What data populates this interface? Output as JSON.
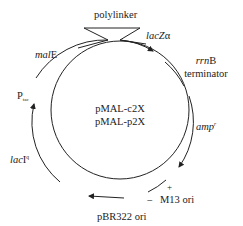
{
  "plasmid": {
    "names": [
      "pMAL-c2X",
      "pMAL-p2X"
    ],
    "line_color": "#222222"
  },
  "labels": {
    "polylinker": "polylinker",
    "lacZ_italic": "lacZ",
    "lacZ_suffix": "α",
    "malE_italic": "mal",
    "malE_suffix": "E",
    "rrnB_italic": "rrn",
    "rrnB_suffix": "B",
    "terminator": "terminator",
    "amp_italic": "amp",
    "amp_sup": "r",
    "m13_plus": "+",
    "m13_minus": "−",
    "m13": "M13 ori",
    "pbr322": "pBR322 ori",
    "lacI_italic": "lac",
    "lacI_suffix": "I",
    "lacI_sup": "q",
    "ptac_main": "P",
    "ptac_sub": "tac"
  }
}
